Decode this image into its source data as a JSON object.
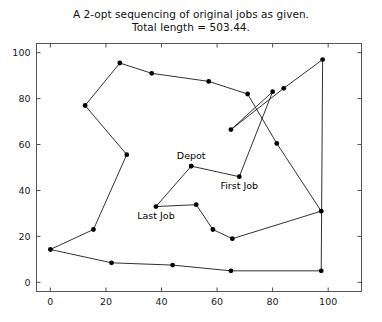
{
  "figure": {
    "title_line_1": "A 2-opt sequencing of original jobs as given.",
    "title_line_2": "Total length = 503.44.",
    "background_color": "#ffffff",
    "line_color": "#1a1a1a",
    "marker_color": "#000000",
    "axis_color": "#4d4d4d"
  },
  "chart_data": {
    "type": "line",
    "title": "A 2-opt sequencing of original jobs as given.\nTotal length = 503.44.",
    "subtitle": "Total length = 503.44.",
    "total_length": 503.44,
    "xlabel": "",
    "ylabel": "",
    "xlim": [
      -5,
      112
    ],
    "ylim": [
      -4,
      104
    ],
    "xticks": [
      0,
      20,
      40,
      60,
      80,
      100
    ],
    "yticks": [
      0,
      20,
      40,
      60,
      80,
      100
    ],
    "xtick_labels": [
      "0",
      "20",
      "40",
      "60",
      "80",
      "100"
    ],
    "ytick_labels": [
      "0",
      "20",
      "40",
      "60",
      "80",
      "100"
    ],
    "grid": false,
    "legend": false,
    "marker": "circle",
    "series": [
      {
        "name": "2-opt tour",
        "x": [
          50.7,
          68.0,
          80.0,
          65.0,
          84.0,
          98.0,
          97.5,
          65.0,
          44.0,
          22.0,
          0.0,
          15.5,
          27.5,
          12.5,
          25.0,
          36.5,
          57.0,
          71.0,
          81.5,
          97.5,
          65.5,
          58.5,
          52.5,
          38.0,
          50.7
        ],
        "y": [
          50.6,
          46.0,
          83.0,
          66.5,
          84.5,
          97.0,
          5.0,
          5.0,
          7.5,
          8.5,
          14.3,
          23.0,
          55.6,
          77.0,
          95.5,
          91.0,
          87.5,
          82.0,
          60.5,
          31.0,
          19.0,
          23.0,
          33.8,
          33.0,
          50.6
        ]
      }
    ],
    "annotations": [
      {
        "label": "Depot",
        "x": 50.7,
        "y": 50.6,
        "position": "above"
      },
      {
        "label": "First Job",
        "x": 68.0,
        "y": 46.0,
        "position": "below"
      },
      {
        "label": "Last Job",
        "x": 38.0,
        "y": 33.0,
        "position": "below"
      }
    ]
  }
}
